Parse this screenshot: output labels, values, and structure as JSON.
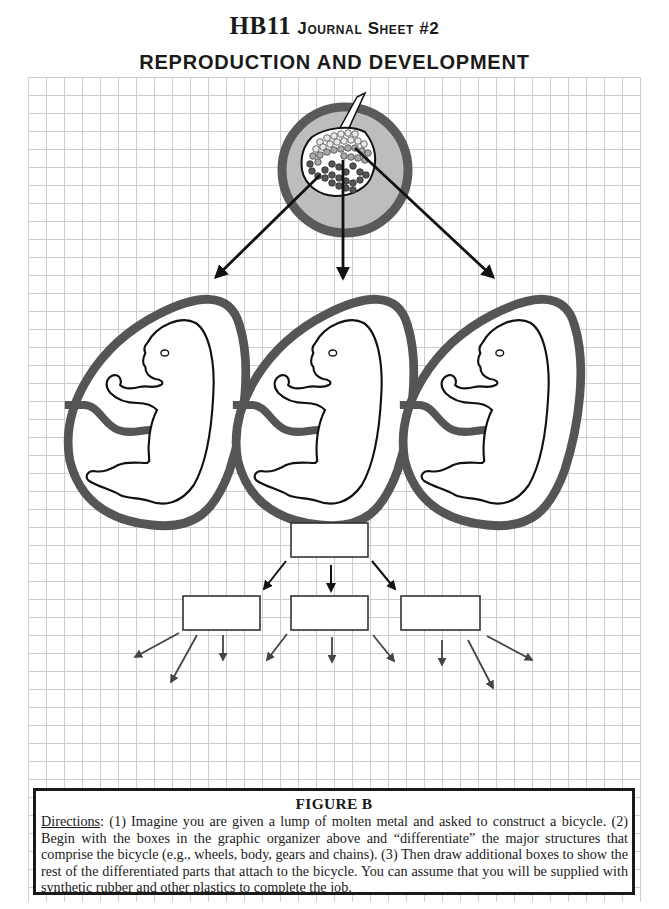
{
  "header": {
    "code": "HB11",
    "sheet_label": "Journal Sheet #2",
    "title": "REPRODUCTION AND DEVELOPMENT"
  },
  "figure": {
    "label": "FIGURE B",
    "illustration": {
      "source": "blastocyst-cell-mass",
      "source_arrows": 3,
      "embryos": [
        "embryo-left",
        "embryo-middle",
        "embryo-right"
      ]
    },
    "organizer": {
      "top_box": "",
      "middle_boxes": [
        "",
        "",
        ""
      ],
      "child_arrows_per_box": [
        3,
        3,
        3
      ]
    }
  },
  "caption": {
    "directions_label": "Directions",
    "directions_text": ": (1) Imagine you are given a lump of molten metal and asked to construct a bicycle. (2) Begin with the boxes in the graphic organizer above and “differentiate” the major structures that comprise the bicycle (e.g., wheels, body, gears and chains). (3) Then draw additional boxes to show the rest of the differentiated parts that attach to the bicycle. You can assume that you will be supplied with synthetic rubber and other plastics to complete the job."
  },
  "colors": {
    "ink": "#1a1a1a",
    "ring_dark": "#555555",
    "disc_fill": "#bdbdbd",
    "grid": "#c8c8c8"
  }
}
